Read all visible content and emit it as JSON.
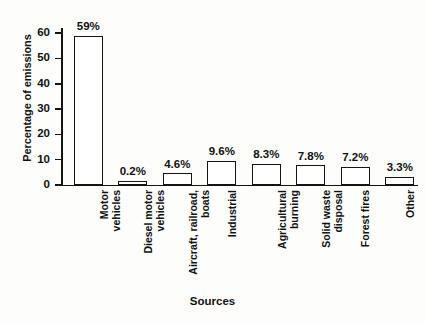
{
  "chart_data": {
    "type": "bar",
    "title": "",
    "xlabel": "Sources",
    "ylabel": "Percentage of emissions",
    "categories": [
      "Motor\nvehicles",
      "Diesel motor\nvehicles",
      "Aircraft, railroad,\nboats",
      "Industrial",
      "Agricultural\nburning",
      "Solid waste\ndisposal",
      "Forest fires",
      "Other"
    ],
    "values": [
      59,
      0.2,
      4.6,
      9.6,
      8.3,
      7.8,
      7.2,
      3.3
    ],
    "data_labels": [
      "59%",
      "0.2%",
      "4.6%",
      "9.6%",
      "8.3%",
      "7.8%",
      "7.2%",
      "3.3%"
    ],
    "ylim": [
      0,
      62
    ],
    "yticks": [
      0,
      10,
      20,
      30,
      40,
      50,
      60
    ],
    "ytick_labels": [
      "0",
      "10",
      "20",
      "30",
      "40",
      "50",
      "60"
    ],
    "grid": false,
    "legend": "none",
    "bar_fill_color": "#ffffff",
    "bar_edge_color": "#141414",
    "axis_color": "#141414",
    "background_color": "#fdfdfc"
  }
}
